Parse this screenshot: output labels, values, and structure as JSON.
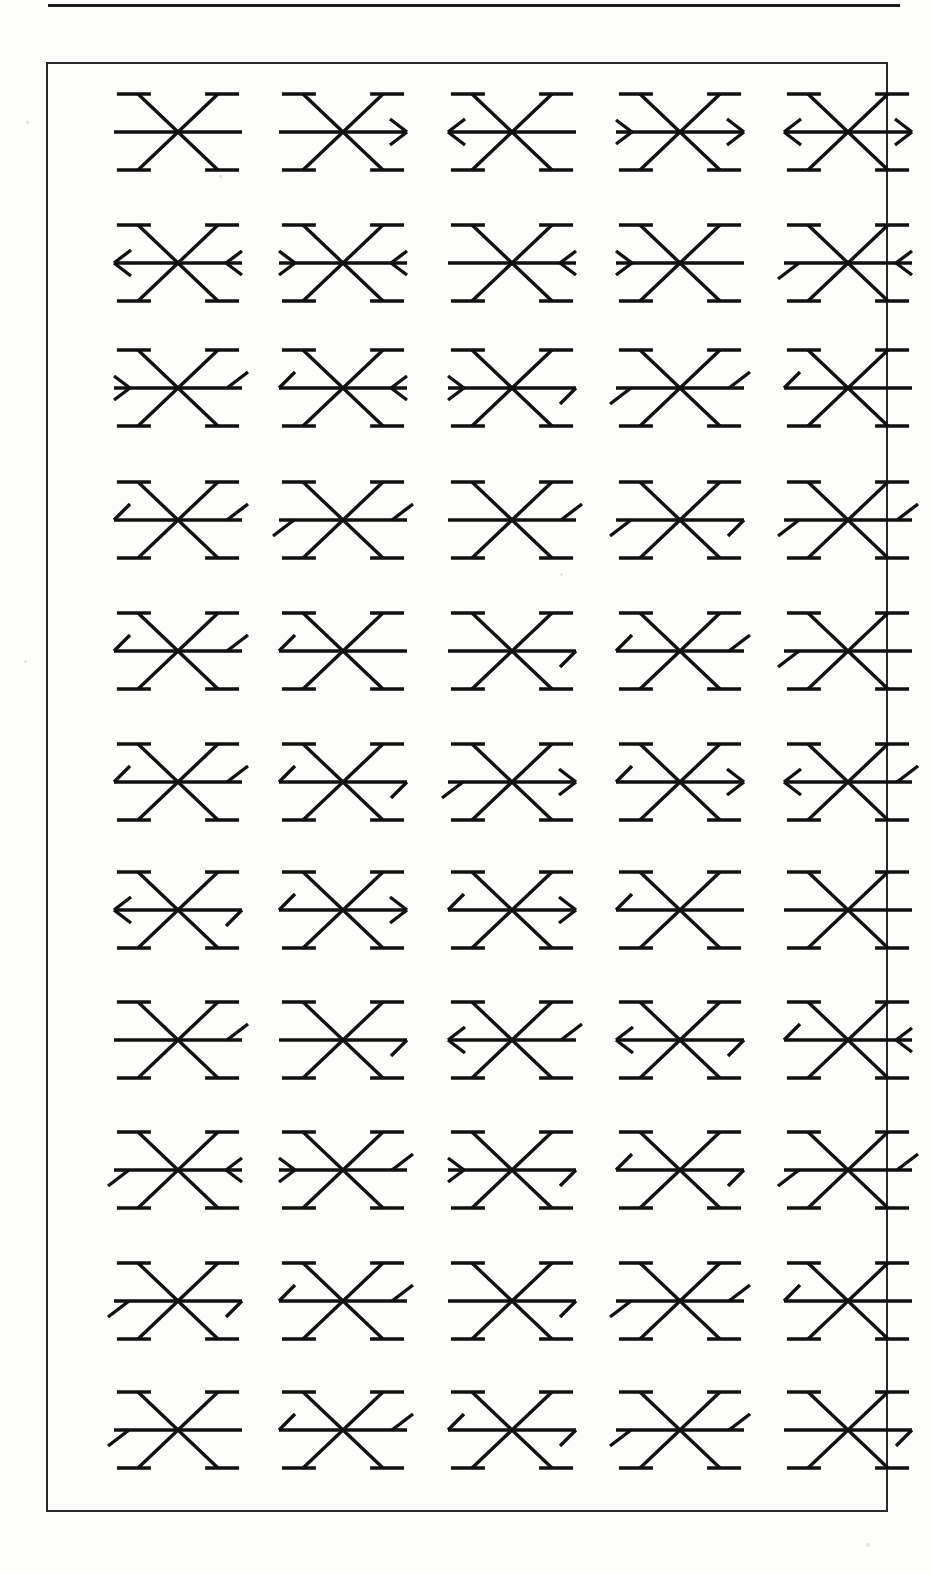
{
  "page": {
    "width": 931,
    "height": 1574,
    "background_color": "#fdfdfc",
    "ink_color": "#111111",
    "top_rule": {
      "present": true,
      "x": 48,
      "y": 4,
      "width": 852,
      "thickness": 3
    },
    "figure_box": {
      "x": 46,
      "y": 62,
      "width": 842,
      "height": 1450,
      "border_color": "#2a2a2a",
      "border_width": 2
    }
  },
  "figure": {
    "rows": 11,
    "columns": 5,
    "total_glyphs": 55,
    "column_centers": [
      130,
      295,
      464,
      632,
      800
    ],
    "row_centers": [
      130,
      261,
      386,
      518,
      649,
      780,
      908,
      1038,
      1168,
      1299,
      1428
    ],
    "glyph_geometry": {
      "spokes": 6,
      "spoke_arms": [
        "left-horizontal",
        "right-horizontal",
        "upper-left-diagonal",
        "upper-right-diagonal",
        "lower-left-diagonal",
        "lower-right-diagonal"
      ],
      "diagonal_cap": "horizontal bar at each diagonal spoke end",
      "horizontal_arm_length": 64,
      "diagonal_dx": 40,
      "diagonal_dy": 38,
      "cap_length": 34,
      "stroke_width": 3.4
    },
    "terminal_types": {
      "plain": "bare spoke end, no decoration",
      "arrow-left": "full arrowhead pointing left (chevron opening right)",
      "arrow-right": "full arrowhead pointing right (chevron opening left)",
      "chev-left": "small chevron < at the end, opening right",
      "chev-right": "small chevron > at the end, opening left",
      "barb-up": "single short stroke angling up and away from the spoke end",
      "barb-down": "single short stroke angling down and away from the spoke end",
      "hook-up": "single short stroke rising from the spoke end toward the center side",
      "hook-down": "single short stroke dropping from the spoke end toward the center side"
    },
    "glyphs": [
      {
        "row": 1,
        "col": 1,
        "left": "plain",
        "right": "plain"
      },
      {
        "row": 1,
        "col": 2,
        "left": "plain",
        "right": "arrow-right"
      },
      {
        "row": 1,
        "col": 3,
        "left": "arrow-left",
        "right": "plain"
      },
      {
        "row": 1,
        "col": 4,
        "left": "chev-right",
        "right": "arrow-right"
      },
      {
        "row": 1,
        "col": 5,
        "left": "arrow-left",
        "right": "arrow-right"
      },
      {
        "row": 2,
        "col": 1,
        "left": "arrow-left",
        "right": "chev-left"
      },
      {
        "row": 2,
        "col": 2,
        "left": "chev-right",
        "right": "chev-left"
      },
      {
        "row": 2,
        "col": 3,
        "left": "plain",
        "right": "chev-left"
      },
      {
        "row": 2,
        "col": 4,
        "left": "chev-right",
        "right": "plain"
      },
      {
        "row": 2,
        "col": 5,
        "left": "barb-down",
        "right": "chev-left"
      },
      {
        "row": 3,
        "col": 1,
        "left": "chev-right",
        "right": "barb-up"
      },
      {
        "row": 3,
        "col": 2,
        "left": "hook-up",
        "right": "chev-left"
      },
      {
        "row": 3,
        "col": 3,
        "left": "chev-right",
        "right": "hook-down"
      },
      {
        "row": 3,
        "col": 4,
        "left": "barb-down",
        "right": "barb-up"
      },
      {
        "row": 3,
        "col": 5,
        "left": "hook-up",
        "right": "plain"
      },
      {
        "row": 4,
        "col": 1,
        "left": "hook-up",
        "right": "barb-up"
      },
      {
        "row": 4,
        "col": 2,
        "left": "barb-down",
        "right": "barb-up"
      },
      {
        "row": 4,
        "col": 3,
        "left": "plain",
        "right": "barb-up"
      },
      {
        "row": 4,
        "col": 4,
        "left": "barb-down",
        "right": "hook-down"
      },
      {
        "row": 4,
        "col": 5,
        "left": "barb-down",
        "right": "barb-up"
      },
      {
        "row": 5,
        "col": 1,
        "left": "hook-up",
        "right": "barb-up"
      },
      {
        "row": 5,
        "col": 2,
        "left": "hook-up",
        "right": "plain"
      },
      {
        "row": 5,
        "col": 3,
        "left": "plain",
        "right": "hook-down"
      },
      {
        "row": 5,
        "col": 4,
        "left": "hook-up",
        "right": "barb-up"
      },
      {
        "row": 5,
        "col": 5,
        "left": "barb-down",
        "right": "plain"
      },
      {
        "row": 6,
        "col": 1,
        "left": "hook-up",
        "right": "barb-up"
      },
      {
        "row": 6,
        "col": 2,
        "left": "hook-up",
        "right": "hook-down"
      },
      {
        "row": 6,
        "col": 3,
        "left": "barb-down",
        "right": "arrow-right"
      },
      {
        "row": 6,
        "col": 4,
        "left": "hook-up",
        "right": "arrow-right"
      },
      {
        "row": 6,
        "col": 5,
        "left": "arrow-left",
        "right": "barb-up"
      },
      {
        "row": 7,
        "col": 1,
        "left": "arrow-left",
        "right": "hook-down"
      },
      {
        "row": 7,
        "col": 2,
        "left": "hook-up",
        "right": "arrow-right"
      },
      {
        "row": 7,
        "col": 3,
        "left": "hook-up",
        "right": "arrow-right"
      },
      {
        "row": 7,
        "col": 4,
        "left": "hook-up",
        "right": "plain"
      },
      {
        "row": 7,
        "col": 5,
        "left": "plain",
        "right": "plain"
      },
      {
        "row": 8,
        "col": 1,
        "left": "plain",
        "right": "barb-up"
      },
      {
        "row": 8,
        "col": 2,
        "left": "plain",
        "right": "hook-down"
      },
      {
        "row": 8,
        "col": 3,
        "left": "arrow-left",
        "right": "barb-up"
      },
      {
        "row": 8,
        "col": 4,
        "left": "arrow-left",
        "right": "hook-down"
      },
      {
        "row": 8,
        "col": 5,
        "left": "hook-up",
        "right": "chev-left"
      },
      {
        "row": 9,
        "col": 1,
        "left": "barb-down",
        "right": "chev-left"
      },
      {
        "row": 9,
        "col": 2,
        "left": "chev-right",
        "right": "barb-up"
      },
      {
        "row": 9,
        "col": 3,
        "left": "chev-right",
        "right": "hook-down"
      },
      {
        "row": 9,
        "col": 4,
        "left": "hook-up",
        "right": "hook-down"
      },
      {
        "row": 9,
        "col": 5,
        "left": "barb-down",
        "right": "barb-up"
      },
      {
        "row": 10,
        "col": 1,
        "left": "barb-down",
        "right": "hook-down"
      },
      {
        "row": 10,
        "col": 2,
        "left": "hook-up",
        "right": "barb-up"
      },
      {
        "row": 10,
        "col": 3,
        "left": "plain",
        "right": "hook-down"
      },
      {
        "row": 10,
        "col": 4,
        "left": "barb-down",
        "right": "barb-up"
      },
      {
        "row": 10,
        "col": 5,
        "left": "hook-up",
        "right": "plain"
      },
      {
        "row": 11,
        "col": 1,
        "left": "barb-down",
        "right": "plain"
      },
      {
        "row": 11,
        "col": 2,
        "left": "hook-up",
        "right": "barb-up"
      },
      {
        "row": 11,
        "col": 3,
        "left": "hook-up",
        "right": "hook-down"
      },
      {
        "row": 11,
        "col": 4,
        "left": "barb-down",
        "right": "barb-up"
      },
      {
        "row": 11,
        "col": 5,
        "left": "plain",
        "right": "hook-down"
      }
    ]
  }
}
